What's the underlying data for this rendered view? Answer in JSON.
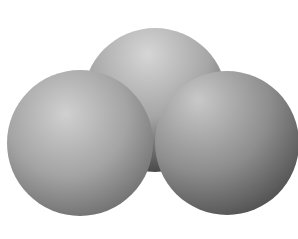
{
  "image": {
    "description": "Grayscale space-filling molecular model with three overlapping spheres (bent triatomic shape)",
    "alt": "Space-filling model of a bent triatomic molecule"
  },
  "spheres": [
    {
      "name": "top-center-atom",
      "cx": 155,
      "cy": 100,
      "r": 72
    },
    {
      "name": "left-atom",
      "cx": 80,
      "cy": 143,
      "r": 73
    },
    {
      "name": "right-atom",
      "cx": 227,
      "cy": 143,
      "r": 72
    }
  ],
  "colors": {
    "background": "#ffffff",
    "highlight": "#d8d8d8",
    "mid": "#a8a8a8",
    "shadow": "#5a5a5a"
  }
}
